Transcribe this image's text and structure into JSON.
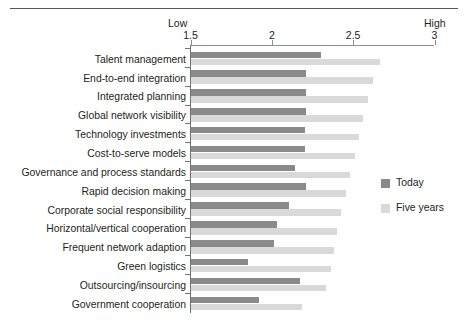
{
  "chart_data": {
    "type": "bar",
    "orientation": "horizontal",
    "title": "",
    "subtitle": "",
    "xlabel": "",
    "ylabel": "",
    "xlim": [
      1.5,
      3
    ],
    "xticks": [
      1.5,
      2,
      2.5,
      3
    ],
    "xtick_labels": [
      "1.5",
      "2",
      "2.5",
      "3"
    ],
    "grid": false,
    "axis_end_labels": {
      "left": "Low",
      "right": "High"
    },
    "legend_position": "right-middle",
    "categories": [
      "Talent management",
      "End-to-end integration",
      "Integrated planning",
      "Global network visibility",
      "Technology investments",
      "Cost-to-serve models",
      "Governance and process standards",
      "Rapid decision making",
      "Corporate social responsibility",
      "Horizontal/vertical cooperation",
      "Frequent network adaption",
      "Green logistics",
      "Outsourcing/insourcing",
      "Government cooperation"
    ],
    "series": [
      {
        "name": "Today",
        "color": "#8a8a8a",
        "values": [
          2.3,
          2.21,
          2.21,
          2.21,
          2.2,
          2.2,
          2.14,
          2.21,
          2.1,
          2.03,
          2.01,
          1.85,
          2.17,
          1.92
        ]
      },
      {
        "name": "Five years",
        "color": "#d9d9d9",
        "values": [
          2.66,
          2.62,
          2.59,
          2.56,
          2.53,
          2.51,
          2.48,
          2.45,
          2.42,
          2.4,
          2.38,
          2.36,
          2.33,
          2.18
        ]
      }
    ]
  },
  "legend": {
    "items": [
      {
        "label": "Today",
        "color": "#8a8a8a"
      },
      {
        "label": "Five years",
        "color": "#d9d9d9"
      }
    ]
  }
}
